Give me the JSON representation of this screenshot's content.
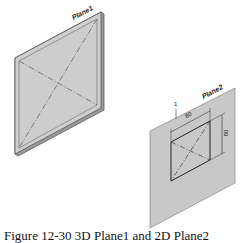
{
  "figure": {
    "caption": "Figure 12-30 3D Plane1 and 2D Plane2",
    "plane1": {
      "label": "Plane1",
      "fill": "#cfcfcf",
      "edge": "#555555"
    },
    "plane2": {
      "label": "Plane2",
      "fill": "#c8c8c8",
      "dimension_width": "80",
      "dimension_height": "80",
      "marker": "1"
    }
  }
}
